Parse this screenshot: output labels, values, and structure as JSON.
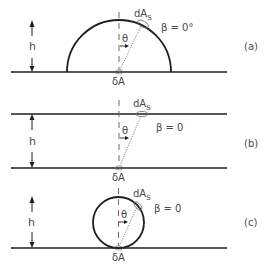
{
  "panels": [
    {
      "id": "a",
      "label": "(a)",
      "height_label": "h",
      "source_label": "δA",
      "element_label": "dA",
      "element_subscript": "S",
      "angle_label": "θ",
      "beta_label": "β = 0°",
      "shape": "hemisphere"
    },
    {
      "id": "b",
      "label": "(b)",
      "height_label": "h",
      "source_label": "δA",
      "element_label": "dA",
      "element_subscript": "S",
      "angle_label": "θ",
      "beta_label": "β = 0",
      "shape": "parallel-plane"
    },
    {
      "id": "c",
      "label": "(c)",
      "height_label": "h",
      "source_label": "δA",
      "element_label": "dA",
      "element_subscript": "S",
      "angle_label": "θ",
      "beta_label": "β = 0",
      "shape": "sphere"
    }
  ]
}
